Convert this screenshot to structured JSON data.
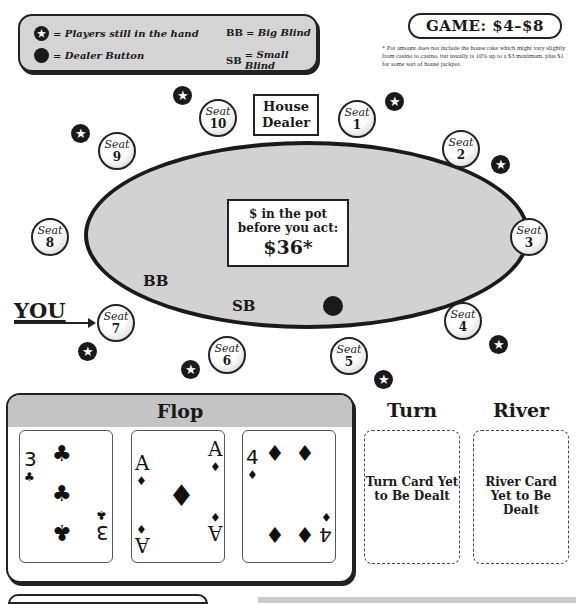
{
  "legend": {
    "star_label": "= Players still in the hand",
    "dealer_label": "= Dealer Button",
    "bb_key": "BB",
    "bb_label": "= Big Blind",
    "sb_key": "SB",
    "sb_label": "= Small Blind",
    "star_glyph": "★"
  },
  "game": {
    "label": "GAME: $4–$8",
    "footnote": "* Pot amount does not include the house rake which might vary slightly from casino to casino, but usually is 10% up to a $3 maximum, plus $1 for some sort of house jackpot."
  },
  "table": {
    "house_dealer": "House Dealer",
    "pot_line1": "$ in the pot",
    "pot_line2": "before you act:",
    "pot_amount": "$36*",
    "bb_marker": "BB",
    "sb_marker": "SB",
    "you_label": "YOU"
  },
  "seats": [
    {
      "word": "Seat",
      "num": "1",
      "in_hand": true
    },
    {
      "word": "Seat",
      "num": "2",
      "in_hand": true
    },
    {
      "word": "Seat",
      "num": "3",
      "in_hand": false
    },
    {
      "word": "Seat",
      "num": "4",
      "in_hand": true
    },
    {
      "word": "Seat",
      "num": "5",
      "in_hand": true
    },
    {
      "word": "Seat",
      "num": "6",
      "in_hand": true
    },
    {
      "word": "Seat",
      "num": "7",
      "in_hand": true
    },
    {
      "word": "Seat",
      "num": "8",
      "in_hand": false
    },
    {
      "word": "Seat",
      "num": "9",
      "in_hand": true
    },
    {
      "word": "Seat",
      "num": "10",
      "in_hand": true
    }
  ],
  "board": {
    "flop_title": "Flop",
    "flop": [
      {
        "rank": "3",
        "suit": "♣",
        "name": "3 of clubs"
      },
      {
        "rank": "A",
        "suit": "♦",
        "name": "Ace of diamonds"
      },
      {
        "rank": "4",
        "suit": "♦",
        "name": "4 of diamonds"
      }
    ],
    "turn_title": "Turn",
    "turn_text": "Turn Card Yet to Be Dealt",
    "river_title": "River",
    "river_text": "River Card Yet to Be Dealt"
  }
}
